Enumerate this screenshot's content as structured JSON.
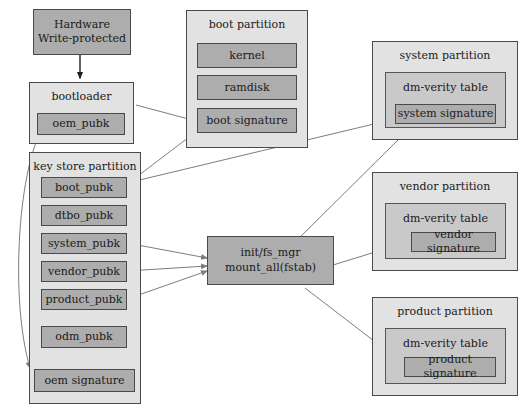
{
  "diagram": {
    "colors": {
      "background": "#ffffff",
      "partition_fill": "#e2e2e2",
      "subgroup_fill": "#c9c9c9",
      "node_fill": "#adadad",
      "border": "#4a4a4a",
      "arrow_light": "#7d7d7d",
      "arrow_dark": "#1d1d1d"
    },
    "nodes": {
      "hardware": {
        "label_line1": "Hardware",
        "label_line2": "Write-protected"
      },
      "bootloader": {
        "title": "bootloader",
        "oem_pubk": "oem_pubk"
      },
      "key_store": {
        "title": "key store partition",
        "keys": [
          "boot_pubk",
          "dtbo_pubk",
          "system_pubk",
          "vendor_pubk",
          "product_pubk",
          "odm_pubk"
        ],
        "oem_signature": "oem signature"
      },
      "boot_partition": {
        "title": "boot partition",
        "items": [
          "kernel",
          "ramdisk",
          "boot signature"
        ]
      },
      "init": {
        "line1": "init/fs_mgr",
        "line2": "mount_all(fstab)"
      },
      "system_partition": {
        "title": "system partition",
        "table": "dm-verity table",
        "signature": "system signature"
      },
      "vendor_partition": {
        "title": "vendor partition",
        "table": "dm-verity table",
        "signature": "vendor signature"
      },
      "product_partition": {
        "title": "product partition",
        "table": "dm-verity table",
        "signature": "product signature"
      }
    }
  }
}
